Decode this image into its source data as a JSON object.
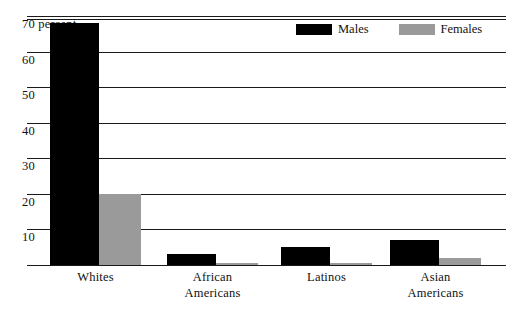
{
  "chart_data": {
    "type": "bar",
    "title": "",
    "xlabel": "",
    "ylabel": "70 percent",
    "ylim": [
      0,
      70
    ],
    "grid": true,
    "legend_position": "top-right",
    "categories": [
      "Whites",
      "African Americans",
      "Latinos",
      "Asian Americans"
    ],
    "category_lines": [
      {
        "line1": "Whites",
        "line2": ""
      },
      {
        "line1": "African",
        "line2": "Americans"
      },
      {
        "line1": "Latinos",
        "line2": ""
      },
      {
        "line1": "Asian",
        "line2": "Americans"
      }
    ],
    "series": [
      {
        "name": "Males",
        "color": "#000000",
        "values": [
          68,
          3,
          5,
          7
        ]
      },
      {
        "name": "Females",
        "color": "#9a9a9a",
        "values": [
          20,
          0.5,
          0.5,
          2
        ]
      }
    ],
    "yticks": [
      {
        "value": 70,
        "label": "70 percent"
      },
      {
        "value": 60,
        "label": "60"
      },
      {
        "value": 50,
        "label": "50"
      },
      {
        "value": 40,
        "label": "40"
      },
      {
        "value": 30,
        "label": "30"
      },
      {
        "value": 20,
        "label": "20"
      },
      {
        "value": 10,
        "label": "10"
      },
      {
        "value": 0,
        "label": ""
      }
    ]
  },
  "legend": {
    "items": [
      {
        "label": "Males",
        "color": "#000000"
      },
      {
        "label": "Females",
        "color": "#9a9a9a"
      }
    ]
  },
  "colors": {
    "males": "#000000",
    "females": "#9a9a9a",
    "axis": "#1a1a1a",
    "background": "#ffffff"
  }
}
